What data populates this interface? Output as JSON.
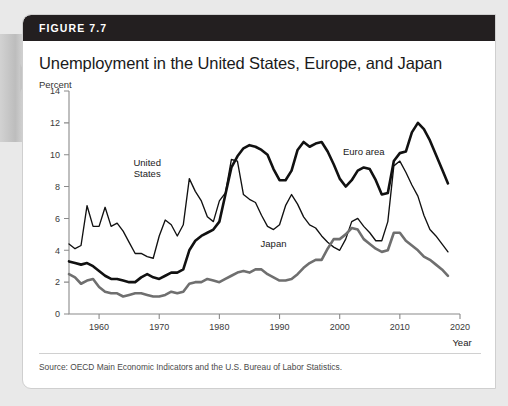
{
  "figure": {
    "number_label": "FIGURE 7.7",
    "title": "Unemployment in the United States, Europe, and Japan",
    "source": "Source: OECD Main Economic Indicators and the U.S. Bureau of Labor Statistics.",
    "header_color": "#231f20"
  },
  "chart_data": {
    "type": "line",
    "title": "Unemployment in the United States, Europe, and Japan",
    "xlabel": "Year",
    "ylabel": "Percent",
    "xlim": [
      1955,
      2020
    ],
    "ylim": [
      0,
      14
    ],
    "ytick_step": 2,
    "yticks": [
      0,
      2,
      4,
      6,
      8,
      10,
      12,
      14
    ],
    "xticks": [
      1960,
      1970,
      1980,
      1990,
      2000,
      2010,
      2020
    ],
    "grid": false,
    "legend": "inline-labels",
    "annotations": [
      {
        "text": "United States",
        "x": 1968,
        "y": 9.3
      },
      {
        "text": "Japan",
        "x": 1989,
        "y": 4.2
      },
      {
        "text": "Euro area",
        "x": 2004,
        "y": 10.0
      }
    ],
    "series": [
      {
        "name": "United States",
        "color": "#111111",
        "style": "thin",
        "x": [
          1955,
          1956,
          1957,
          1958,
          1959,
          1960,
          1961,
          1962,
          1963,
          1964,
          1965,
          1966,
          1967,
          1968,
          1969,
          1970,
          1971,
          1972,
          1973,
          1974,
          1975,
          1976,
          1977,
          1978,
          1979,
          1980,
          1981,
          1982,
          1983,
          1984,
          1985,
          1986,
          1987,
          1988,
          1989,
          1990,
          1991,
          1992,
          1993,
          1994,
          1995,
          1996,
          1997,
          1998,
          1999,
          2000,
          2001,
          2002,
          2003,
          2004,
          2005,
          2006,
          2007,
          2008,
          2009,
          2010,
          2011,
          2012,
          2013,
          2014,
          2015,
          2016,
          2017,
          2018
        ],
        "values": [
          4.4,
          4.1,
          4.3,
          6.8,
          5.5,
          5.5,
          6.7,
          5.5,
          5.7,
          5.2,
          4.5,
          3.8,
          3.8,
          3.6,
          3.5,
          4.9,
          5.9,
          5.6,
          4.9,
          5.6,
          8.5,
          7.7,
          7.1,
          6.1,
          5.8,
          7.1,
          7.6,
          9.7,
          9.6,
          7.5,
          7.2,
          7.0,
          6.2,
          5.5,
          5.3,
          5.6,
          6.8,
          7.5,
          6.9,
          6.1,
          5.6,
          5.4,
          4.9,
          4.5,
          4.2,
          4.0,
          4.7,
          5.8,
          6.0,
          5.5,
          5.1,
          4.6,
          4.6,
          5.8,
          9.3,
          9.6,
          8.9,
          8.1,
          7.4,
          6.2,
          5.3,
          4.9,
          4.4,
          3.9
        ]
      },
      {
        "name": "Euro area",
        "color": "#111111",
        "style": "thick",
        "x": [
          1955,
          1956,
          1957,
          1958,
          1959,
          1960,
          1961,
          1962,
          1963,
          1964,
          1965,
          1966,
          1967,
          1968,
          1969,
          1970,
          1971,
          1972,
          1973,
          1974,
          1975,
          1976,
          1977,
          1978,
          1979,
          1980,
          1981,
          1982,
          1983,
          1984,
          1985,
          1986,
          1987,
          1988,
          1989,
          1990,
          1991,
          1992,
          1993,
          1994,
          1995,
          1996,
          1997,
          1998,
          1999,
          2000,
          2001,
          2002,
          2003,
          2004,
          2005,
          2006,
          2007,
          2008,
          2009,
          2010,
          2011,
          2012,
          2013,
          2014,
          2015,
          2016,
          2017,
          2018
        ],
        "values": [
          3.3,
          3.2,
          3.1,
          3.2,
          3.0,
          2.7,
          2.4,
          2.2,
          2.2,
          2.1,
          2.0,
          2.0,
          2.3,
          2.5,
          2.3,
          2.2,
          2.4,
          2.6,
          2.6,
          2.8,
          4.0,
          4.6,
          4.9,
          5.1,
          5.3,
          5.8,
          7.5,
          9.2,
          9.9,
          10.4,
          10.6,
          10.5,
          10.3,
          10.0,
          9.1,
          8.4,
          8.4,
          9.0,
          10.3,
          10.8,
          10.5,
          10.7,
          10.8,
          10.2,
          9.4,
          8.5,
          8.0,
          8.4,
          9.0,
          9.2,
          9.1,
          8.4,
          7.5,
          7.6,
          9.6,
          10.1,
          10.2,
          11.4,
          12.0,
          11.6,
          10.9,
          10.0,
          9.1,
          8.2
        ]
      },
      {
        "name": "Japan",
        "color": "#6f6f6f",
        "style": "thick",
        "x": [
          1955,
          1956,
          1957,
          1958,
          1959,
          1960,
          1961,
          1962,
          1963,
          1964,
          1965,
          1966,
          1967,
          1968,
          1969,
          1970,
          1971,
          1972,
          1973,
          1974,
          1975,
          1976,
          1977,
          1978,
          1979,
          1980,
          1981,
          1982,
          1983,
          1984,
          1985,
          1986,
          1987,
          1988,
          1989,
          1990,
          1991,
          1992,
          1993,
          1994,
          1995,
          1996,
          1997,
          1998,
          1999,
          2000,
          2001,
          2002,
          2003,
          2004,
          2005,
          2006,
          2007,
          2008,
          2009,
          2010,
          2011,
          2012,
          2013,
          2014,
          2015,
          2016,
          2017,
          2018
        ],
        "values": [
          2.5,
          2.3,
          1.9,
          2.1,
          2.2,
          1.7,
          1.4,
          1.3,
          1.3,
          1.1,
          1.2,
          1.3,
          1.3,
          1.2,
          1.1,
          1.1,
          1.2,
          1.4,
          1.3,
          1.4,
          1.9,
          2.0,
          2.0,
          2.2,
          2.1,
          2.0,
          2.2,
          2.4,
          2.6,
          2.7,
          2.6,
          2.8,
          2.8,
          2.5,
          2.3,
          2.1,
          2.1,
          2.2,
          2.5,
          2.9,
          3.2,
          3.4,
          3.4,
          4.1,
          4.7,
          4.7,
          5.0,
          5.4,
          5.3,
          4.7,
          4.4,
          4.1,
          3.9,
          4.0,
          5.1,
          5.1,
          4.6,
          4.3,
          4.0,
          3.6,
          3.4,
          3.1,
          2.8,
          2.4
        ]
      }
    ]
  }
}
